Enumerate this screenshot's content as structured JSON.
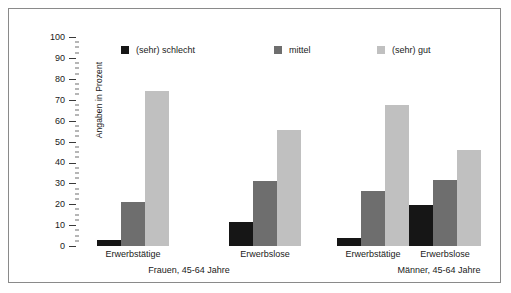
{
  "chart_data": {
    "type": "bar",
    "title": "",
    "subtitle": "",
    "xlabel": "",
    "ylabel": "Angaben in Prozent",
    "ylim": [
      0,
      100
    ],
    "ytick_step": 10,
    "yminor_step": 2.5,
    "grid": false,
    "legend_position": "top-inside",
    "yticks": [
      "100",
      "90",
      "80",
      "70",
      "60",
      "50",
      "40",
      "30",
      "20",
      "10",
      "0"
    ],
    "legend": [
      {
        "label": "(sehr) schlecht",
        "color": "#161616"
      },
      {
        "label": "mittel",
        "color": "#6e6e6e"
      },
      {
        "label": "(sehr) gut",
        "color": "#c0c0c0"
      }
    ],
    "series": [
      {
        "name": "(sehr) schlecht",
        "color": "#161616",
        "values": [
          3,
          11.5,
          4,
          19.5
        ]
      },
      {
        "name": "mittel",
        "color": "#6e6e6e",
        "values": [
          21,
          31,
          26.5,
          31.5
        ]
      },
      {
        "name": "(sehr) gut",
        "color": "#c0c0c0",
        "values": [
          74,
          55.5,
          67.5,
          46
        ]
      }
    ],
    "categories": [
      "Erwerbstätige",
      "Erwerbslose",
      "Erwerbstätige",
      "Erwerbslose"
    ],
    "groups": [
      {
        "label": "Frauen, 45-64 Jahre",
        "categories": [
          "Erwerbstätige",
          "Erwerbslose"
        ]
      },
      {
        "label": "Männer, 45-64 Jahre",
        "categories": [
          "Erwerbstätige",
          "Erwerbslose"
        ]
      }
    ]
  }
}
